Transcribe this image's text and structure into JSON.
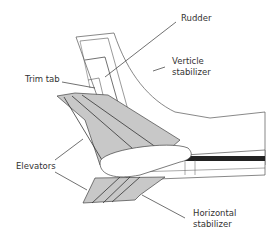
{
  "diagram": {
    "labels": {
      "rudder": "Rudder",
      "vertical_stabilizer_line1": "Verticle",
      "vertical_stabilizer_line2": "stabilizer",
      "trim_tab": "Trim tab",
      "elevators": "Elevators",
      "horizontal_stabilizer_line1": "Horizontal",
      "horizontal_stabilizer_line2": "stabilizer"
    },
    "colors": {
      "surface_fill": "#c8c8c8",
      "outline": "#444444",
      "leader_line": "#333333",
      "fuselage_stripe": "#222222"
    }
  }
}
